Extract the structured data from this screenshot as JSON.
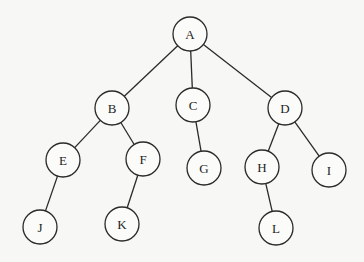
{
  "diagram": {
    "type": "tree",
    "node_radius": 17,
    "nodes": [
      {
        "id": "A",
        "label": "A",
        "x": 190,
        "y": 34
      },
      {
        "id": "B",
        "label": "B",
        "x": 112,
        "y": 108
      },
      {
        "id": "C",
        "label": "C",
        "x": 193,
        "y": 105
      },
      {
        "id": "D",
        "label": "D",
        "x": 285,
        "y": 108
      },
      {
        "id": "E",
        "label": "E",
        "x": 63,
        "y": 160
      },
      {
        "id": "F",
        "label": "F",
        "x": 143,
        "y": 159
      },
      {
        "id": "G",
        "label": "G",
        "x": 204,
        "y": 168
      },
      {
        "id": "H",
        "label": "H",
        "x": 262,
        "y": 167
      },
      {
        "id": "I",
        "label": "I",
        "x": 329,
        "y": 170
      },
      {
        "id": "J",
        "label": "J",
        "x": 40,
        "y": 227
      },
      {
        "id": "K",
        "label": "K",
        "x": 122,
        "y": 224
      },
      {
        "id": "L",
        "label": "L",
        "x": 276,
        "y": 228
      }
    ],
    "edges": [
      {
        "from": "A",
        "to": "B"
      },
      {
        "from": "A",
        "to": "C"
      },
      {
        "from": "A",
        "to": "D"
      },
      {
        "from": "B",
        "to": "E"
      },
      {
        "from": "B",
        "to": "F"
      },
      {
        "from": "C",
        "to": "G"
      },
      {
        "from": "D",
        "to": "H"
      },
      {
        "from": "D",
        "to": "I"
      },
      {
        "from": "E",
        "to": "J"
      },
      {
        "from": "F",
        "to": "K"
      },
      {
        "from": "H",
        "to": "L"
      }
    ]
  }
}
